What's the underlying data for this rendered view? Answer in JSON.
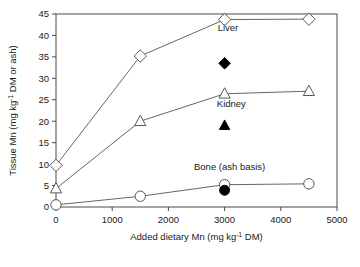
{
  "chart_data": {
    "type": "scatter",
    "title": "",
    "xlabel": "Added dietary Mn (mg kg⁻¹ DM)",
    "ylabel": "Tissue Mn (mg kg⁻¹ DM or ash)",
    "xlim": [
      0,
      5000
    ],
    "ylim": [
      0,
      45
    ],
    "xticks": [
      0,
      1000,
      2000,
      3000,
      4000,
      5000
    ],
    "xtick_labels": [
      "0",
      "1000",
      "2000",
      "3000",
      "4000",
      "5000"
    ],
    "yticks": [
      0,
      5,
      10,
      15,
      20,
      25,
      30,
      35,
      40,
      45
    ],
    "ytick_labels": [
      "0",
      "5",
      "10",
      "15",
      "20",
      "25",
      "30",
      "35",
      "40",
      "45"
    ],
    "grid": false,
    "legend_position": "inline-annotations",
    "series": [
      {
        "name": "Liver",
        "marker": "open-diamond",
        "connected": true,
        "x": [
          0,
          1500,
          3000,
          4500
        ],
        "values": [
          9.7,
          35.2,
          43.7,
          43.8
        ]
      },
      {
        "name": "Liver (filled)",
        "marker": "filled-diamond",
        "connected": false,
        "x": [
          3000
        ],
        "values": [
          33.5
        ]
      },
      {
        "name": "Kidney",
        "marker": "open-triangle",
        "connected": true,
        "x": [
          0,
          1500,
          3000,
          4500
        ],
        "values": [
          4.3,
          20.0,
          26.4,
          27.0
        ]
      },
      {
        "name": "Kidney (filled)",
        "marker": "filled-triangle",
        "connected": false,
        "x": [
          3000
        ],
        "values": [
          19.0
        ]
      },
      {
        "name": "Bone (ash basis)",
        "marker": "open-circle",
        "connected": true,
        "x": [
          0,
          1500,
          3000,
          4500
        ],
        "values": [
          0.5,
          2.5,
          5.2,
          5.4
        ]
      },
      {
        "name": "Bone (ash basis) (filled)",
        "marker": "filled-circle",
        "connected": false,
        "x": [
          3000
        ],
        "values": [
          3.9
        ]
      }
    ],
    "annotations": [
      {
        "text": "Liver",
        "x": 3060,
        "y": 41.0
      },
      {
        "text": "Kidney",
        "x": 3120,
        "y": 23.3
      },
      {
        "text": "Bone (ash basis)",
        "x": 3090,
        "y": 8.6
      }
    ],
    "colors": {
      "axis": "#4a4a4a",
      "line": "#555555",
      "marker_fill_open": "#ffffff",
      "marker_stroke": "#444444",
      "marker_filled": "#000000",
      "text": "#1a1a1a",
      "background": "#ffffff"
    }
  }
}
